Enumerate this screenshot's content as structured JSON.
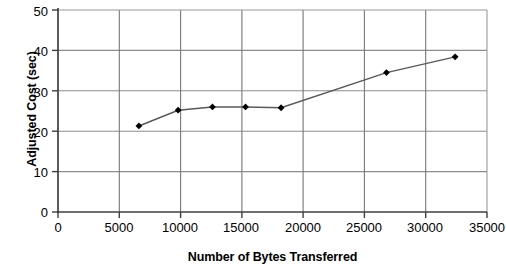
{
  "chart_data": {
    "type": "line",
    "title": "",
    "xlabel": "Number of Bytes Transferred",
    "ylabel": "Adjusted Cost (sec)",
    "xlim": [
      0,
      35000
    ],
    "ylim": [
      0,
      50
    ],
    "xticks": [
      "0",
      "5000",
      "10000",
      "15000",
      "20000",
      "25000",
      "30000",
      "35000"
    ],
    "xtick_values": [
      0,
      5000,
      10000,
      15000,
      20000,
      25000,
      30000,
      35000
    ],
    "yticks": [
      "0",
      "10",
      "20",
      "30",
      "40",
      "50"
    ],
    "ytick_values": [
      0,
      10,
      20,
      30,
      40,
      50
    ],
    "grid": "both",
    "legend": "none",
    "series": [
      {
        "name": "Adjusted Cost",
        "marker": "diamond",
        "marker_color": "#000000",
        "line_color": "#595959",
        "x": [
          6600,
          9800,
          12600,
          15300,
          18200,
          26800,
          32400
        ],
        "y": [
          21.3,
          25.2,
          26.0,
          26.0,
          25.8,
          34.5,
          38.4
        ]
      }
    ]
  },
  "axes": {
    "y_title": "Adjusted Cost (sec)",
    "x_title": "Number of Bytes Transferred"
  },
  "colors": {
    "gridline": "#8c8c8c",
    "axis": "#3f3f3f",
    "line": "#595959",
    "marker": "#000000",
    "background": "#ffffff"
  }
}
